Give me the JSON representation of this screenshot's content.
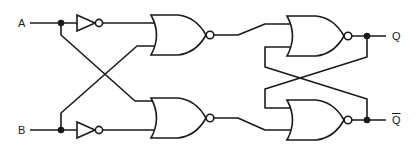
{
  "diagram": {
    "type": "logic-circuit",
    "inputs": [
      {
        "id": "A",
        "label": "A"
      },
      {
        "id": "B",
        "label": "B"
      }
    ],
    "outputs": [
      {
        "id": "Q",
        "label": "Q"
      },
      {
        "id": "Qbar",
        "label": "Q",
        "overline": true
      }
    ],
    "components": [
      {
        "id": "inv-a",
        "type": "NOT",
        "input": "A"
      },
      {
        "id": "inv-b",
        "type": "NOT",
        "input": "B"
      },
      {
        "id": "nor-1",
        "type": "NOR",
        "inputs": [
          "inv-a",
          "B"
        ]
      },
      {
        "id": "nor-2",
        "type": "NOR",
        "inputs": [
          "A",
          "inv-b"
        ]
      },
      {
        "id": "nor-3",
        "type": "NOR",
        "inputs": [
          "nor-1",
          "Qbar"
        ],
        "output": "Q"
      },
      {
        "id": "nor-4",
        "type": "NOR",
        "inputs": [
          "Q",
          "nor-2"
        ],
        "output": "Qbar"
      }
    ],
    "colors": {
      "ink": "#1a1a1a",
      "background": "#ffffff"
    }
  }
}
